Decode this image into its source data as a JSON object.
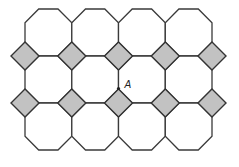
{
  "figure": {
    "grid": {
      "columns": 4,
      "rows": 3,
      "origin_x": 25,
      "origin_y": 9,
      "cell_width": 46.75,
      "cell_height": 47,
      "corner_cut": 13.7
    },
    "diamond_half_diagonal": 14,
    "colors": {
      "octagon_fill": "#ffffff",
      "diamond_fill": "#c2c2c2",
      "stroke": "#333333"
    },
    "point": {
      "label": "A",
      "x": 118.5,
      "y": 88.5
    }
  }
}
